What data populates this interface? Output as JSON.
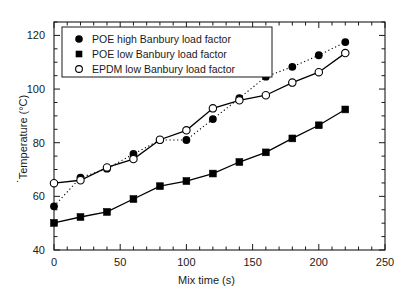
{
  "chart_data": {
    "type": "line",
    "title": "",
    "xlabel": "Mix time (s)",
    "ylabel": "Temperature (°C)",
    "xlim": [
      0,
      250
    ],
    "ylim": [
      40,
      125
    ],
    "xticks": [
      0,
      50,
      100,
      150,
      200,
      250
    ],
    "yticks": [
      40,
      60,
      80,
      100,
      120
    ],
    "xtick_labels": [
      "0",
      "50",
      "100",
      "150",
      "200",
      "250"
    ],
    "ytick_labels": [
      "40",
      "60",
      "80",
      "100",
      "120"
    ],
    "x_minor_tick_step": 10,
    "y_minor_tick_step": 5,
    "grid": false,
    "legend_position": "top-left",
    "series": [
      {
        "name": "POE high Banbury load factor",
        "marker": "filled-circle",
        "line_style": "dotted",
        "color": "#000000",
        "x": [
          0,
          20,
          40,
          60,
          80,
          100,
          120,
          140,
          160,
          180,
          200,
          220
        ],
        "values": [
          56.3,
          67.0,
          70.3,
          75.8,
          81.0,
          81.0,
          88.8,
          96.6,
          104.6,
          108.3,
          112.6,
          117.5
        ]
      },
      {
        "name": "POE low Banbury load factor",
        "marker": "filled-square",
        "line_style": "solid",
        "color": "#000000",
        "x": [
          0,
          20,
          40,
          60,
          80,
          100,
          120,
          140,
          160,
          180,
          200,
          220
        ],
        "values": [
          50.1,
          52.3,
          54.2,
          59.0,
          63.8,
          65.7,
          68.5,
          72.8,
          76.4,
          81.6,
          86.5,
          92.4
        ]
      },
      {
        "name": "EPDM low Banbury load factor",
        "marker": "open-circle",
        "line_style": "solid",
        "color": "#000000",
        "x": [
          0,
          20,
          40,
          60,
          80,
          100,
          120,
          140,
          160,
          180,
          200,
          220
        ],
        "values": [
          64.9,
          66.0,
          70.8,
          73.9,
          81.1,
          84.6,
          92.8,
          95.8,
          97.7,
          102.4,
          106.3,
          113.4
        ]
      }
    ],
    "stray_mark": "."
  },
  "legend": {
    "items": [
      {
        "label": "POE high Banbury load factor",
        "marker": "filled-circle"
      },
      {
        "label": "POE low Banbury load factor",
        "marker": "filled-square"
      },
      {
        "label": "EPDM low Banbury load factor",
        "marker": "open-circle"
      }
    ]
  }
}
